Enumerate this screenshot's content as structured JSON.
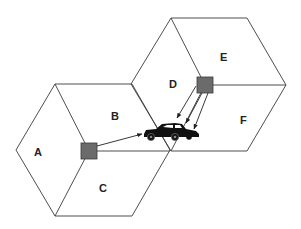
{
  "diagram": {
    "type": "cellular-sectorized-hexagons",
    "cells": [
      {
        "name": "left-cell",
        "sectors": [
          {
            "label": "A"
          },
          {
            "label": "B"
          },
          {
            "label": "C"
          }
        ]
      },
      {
        "name": "right-cell",
        "sectors": [
          {
            "label": "D"
          },
          {
            "label": "E"
          },
          {
            "label": "F"
          }
        ]
      }
    ],
    "base_stations": 2,
    "mobile": "car",
    "colors": {
      "lines": "#3a3a3a",
      "base_station": "#6b6b6b",
      "car": "#111111",
      "background": "#ffffff"
    }
  },
  "labels": {
    "A": "A",
    "B": "B",
    "C": "C",
    "D": "D",
    "E": "E",
    "F": "F"
  }
}
